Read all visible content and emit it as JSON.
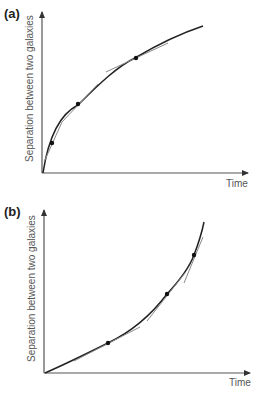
{
  "panels": [
    {
      "label": "(a)",
      "ylabel": "Separation between two galaxies",
      "xlabel": "Time",
      "curve": "decelerating (concave down)",
      "tangent_points": 3
    },
    {
      "label": "(b)",
      "ylabel": "Separation between two galaxies",
      "xlabel": "Time",
      "curve": "accelerating (concave up)",
      "tangent_points": 3
    }
  ],
  "colors": {
    "axis": "#333333",
    "curve": "#222222",
    "tangent": "#888888",
    "text": "#555555"
  }
}
